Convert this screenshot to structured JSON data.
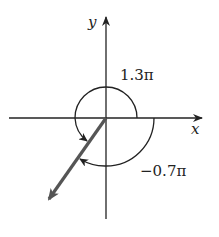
{
  "diagram": {
    "type": "angle-diagram",
    "axes": {
      "x_label": "x",
      "y_label": "y"
    },
    "angles": [
      {
        "label": "1.3π",
        "direction": "counterclockwise",
        "radians": "1.3π"
      },
      {
        "label": "−0.7π",
        "direction": "clockwise",
        "radians": "-0.7π"
      }
    ],
    "vector": {
      "description": "terminal side in third quadrant",
      "angle": "1.3π"
    },
    "colors": {
      "axis": "#222222",
      "vector": "#555555",
      "arc": "#222222"
    }
  }
}
